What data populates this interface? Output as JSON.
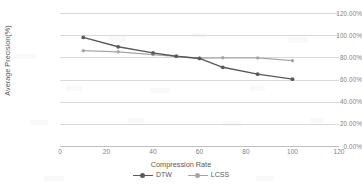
{
  "chart_data": {
    "type": "line",
    "title": "",
    "xlabel": "Compression Rate",
    "ylabel": "Average Precision(%)",
    "xlim": [
      0,
      120
    ],
    "ylim": [
      0,
      120
    ],
    "xticks": [
      "0",
      "20",
      "40",
      "60",
      "80",
      "100",
      "120"
    ],
    "xtick_values": [
      0,
      20,
      40,
      60,
      80,
      100,
      120
    ],
    "yticks": [
      "0.00%",
      "20.00%",
      "40.00%",
      "60.00%",
      "80.00%",
      "100.00%",
      "120.00%"
    ],
    "ytick_values": [
      0,
      20,
      40,
      60,
      80,
      100,
      120
    ],
    "grid": "horizontal",
    "legend_position": "bottom",
    "x": [
      10,
      25,
      40,
      50,
      60,
      70,
      85,
      100
    ],
    "series": [
      {
        "name": "DTW",
        "color": "#595959",
        "marker": "circle",
        "values": [
          98.0,
          89.5,
          84.0,
          81.0,
          79.0,
          71.0,
          64.8,
          60.3
        ]
      },
      {
        "name": "LCSS",
        "color": "#a6a6a6",
        "marker": "circle",
        "values": [
          86.0,
          85.0,
          82.5,
          80.8,
          79.3,
          79.6,
          79.5,
          77.0
        ]
      }
    ]
  },
  "legend": {
    "items": [
      {
        "label": "DTW",
        "color": "#595959"
      },
      {
        "label": "LCSS",
        "color": "#a6a6a6"
      }
    ]
  },
  "axes": {
    "x_title": "Compression Rate",
    "y_title": "Average Precision(%)"
  }
}
